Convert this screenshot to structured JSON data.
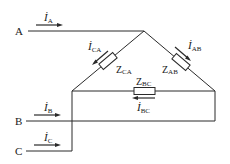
{
  "diagram": {
    "type": "three-phase delta-connected load circuit",
    "nodes": {
      "A": "A",
      "B": "B",
      "C": "C"
    },
    "line_currents": [
      {
        "symbol": "İ",
        "sub": "A"
      },
      {
        "symbol": "İ",
        "sub": "B"
      },
      {
        "symbol": "İ",
        "sub": "C"
      }
    ],
    "phase_currents": [
      {
        "symbol": "İ",
        "sub": "CA"
      },
      {
        "symbol": "İ",
        "sub": "AB"
      },
      {
        "symbol": "İ",
        "sub": "BC"
      }
    ],
    "impedances": [
      {
        "symbol": "Z",
        "sub": "CA"
      },
      {
        "symbol": "Z",
        "sub": "AB"
      },
      {
        "symbol": "Z",
        "sub": "BC"
      }
    ],
    "colors": {
      "line": "#2a2a2a",
      "background": "#ffffff"
    }
  }
}
